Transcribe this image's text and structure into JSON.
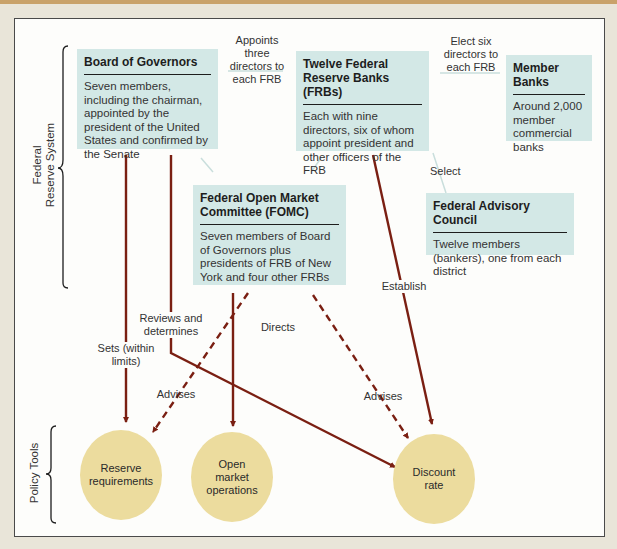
{
  "colors": {
    "background": "#e9e5d9",
    "panel": "#fdfdfb",
    "box_fill": "#d3e8e6",
    "circle_fill": "#ecdc9e",
    "arrow": "#7a1f12",
    "connector": "#c9dedc"
  },
  "groups": {
    "federal_reserve_system": "Federal\nReserve System",
    "federal_reserve_system_line1": "Federal",
    "federal_reserve_system_line2": "Reserve System",
    "policy_tools": "Policy Tools"
  },
  "entities": {
    "board_of_governors": {
      "title": "Board of Governors",
      "description": "Seven members, including the chairman, appointed by the president of the United States and confirmed by the Senate"
    },
    "frbs": {
      "title": "Twelve Federal Reserve Banks (FRBs)",
      "description": "Each with nine directors, six of whom appoint president and other officers of the FRB"
    },
    "member_banks": {
      "title": "Member Banks",
      "description": "Around 2,000 member commercial banks"
    },
    "fomc": {
      "title": "Federal Open Market Committee (FOMC)",
      "description": "Seven members of Board of Governors plus presidents of FRB of New York and four other FRBs"
    },
    "advisory_council": {
      "title": "Federal Advisory Council",
      "description": "Twelve members (bankers), one from each district"
    }
  },
  "policy_tools": [
    {
      "id": "reserve_requirements",
      "label": "Reserve requirements"
    },
    {
      "id": "open_market_operations",
      "label": "Open market operations"
    },
    {
      "id": "discount_rate",
      "label": "Discount rate"
    }
  ],
  "relations": {
    "appoints": "Appoints three directors to each FRB",
    "elect": "Elect six directors to each FRB",
    "select": "Select",
    "sets": "Sets (within limits)",
    "reviews": "Reviews and determines",
    "directs": "Directs",
    "establish": "Establish",
    "advises_left": "Advises",
    "advises_right": "Advises"
  }
}
